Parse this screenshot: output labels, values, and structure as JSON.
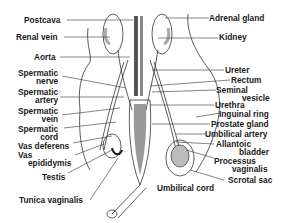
{
  "diagram": {
    "left_labels": [
      {
        "id": "postcava",
        "text": "Postcava"
      },
      {
        "id": "renal_vein",
        "text": "Renal vein"
      },
      {
        "id": "aorta",
        "text": "Aorta"
      },
      {
        "id": "spermatic_nerve",
        "line1": "Spermatic",
        "line2": "nerve"
      },
      {
        "id": "spermatic_artery",
        "line1": "Spermatic",
        "line2": "artery"
      },
      {
        "id": "spermatic_vein",
        "line1": "Spermatic",
        "line2": "vein"
      },
      {
        "id": "spermatic_cord",
        "line1": "Spermatic",
        "line2": "cord"
      },
      {
        "id": "vas_deferens",
        "text": "Vas deferens"
      },
      {
        "id": "vas_epididymis",
        "line1": "Vas",
        "line2": "epididymis"
      },
      {
        "id": "testis",
        "text": "Testis"
      },
      {
        "id": "tunica_vaginalis",
        "text": "Tunica vaginalis"
      }
    ],
    "right_labels": [
      {
        "id": "adrenal_gland",
        "text": "Adrenal gland"
      },
      {
        "id": "kidney",
        "text": "Kidney"
      },
      {
        "id": "ureter",
        "text": "Ureter"
      },
      {
        "id": "rectum",
        "text": "Rectum"
      },
      {
        "id": "seminal_vesicle",
        "line1": "Seminal",
        "line2": "vesicle"
      },
      {
        "id": "urethra",
        "text": "Urethra"
      },
      {
        "id": "inguinal_ring",
        "text": "Inguinal ring"
      },
      {
        "id": "prostate_gland",
        "text": "Prostate gland"
      },
      {
        "id": "umbilical_artery",
        "text": "Umbilical artery"
      },
      {
        "id": "allantoic_bladder",
        "line1": "Allantoic",
        "line2": "bladder"
      },
      {
        "id": "processus_vaginalis",
        "line1": "Processus",
        "line2": "vaginalis"
      },
      {
        "id": "scrotal_sac",
        "text": "Scrotal sac"
      },
      {
        "id": "umbilical_cord",
        "text": "Umbilical cord"
      }
    ]
  }
}
